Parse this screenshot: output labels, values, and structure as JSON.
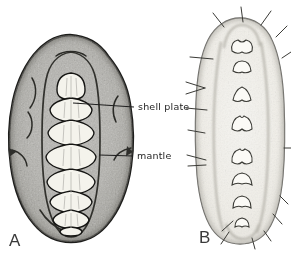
{
  "panels": {
    "a": {
      "letter": "A"
    },
    "b": {
      "letter": "B"
    }
  },
  "annotations": {
    "shell_plate": {
      "label": "shell plate"
    },
    "mantle": {
      "label": "mantle"
    }
  },
  "colors": {
    "background": "#ffffff",
    "mantle_gray": "#9f9e99",
    "plate_white": "#f4f3ec",
    "body_b_light": "#eceae4",
    "outline_dark": "#1d1d1b",
    "label_text": "#1e1e1e",
    "panel_letter": "#3a3a3a"
  }
}
